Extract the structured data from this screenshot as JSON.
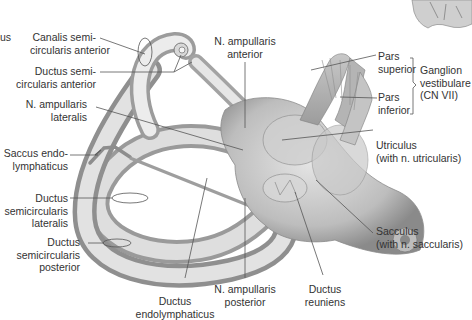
{
  "figure": {
    "colors": {
      "background": "#ffffff",
      "tissue_light": "#e9e9e9",
      "tissue_mid": "#bdbdbd",
      "tissue_dark": "#7a7a7a",
      "leader": "#555555",
      "text": "#333333"
    },
    "cropped_fragment": {
      "text": "us"
    },
    "labels": {
      "canalis_anterior": [
        "Canalis semi-",
        "circularis anterior"
      ],
      "ductus_anterior": [
        "Ductus semi-",
        "circularis anterior"
      ],
      "n_ampullaris_lateralis": [
        "N. ampullaris",
        "lateralis"
      ],
      "saccus": [
        "Saccus endo-",
        "lymphaticus"
      ],
      "ductus_lateralis": [
        "Ductus",
        "semicircularis",
        "lateralis"
      ],
      "ductus_posterior": [
        "Ductus",
        "semicircularis",
        "posterior"
      ],
      "ductus_endolymphaticus": [
        "Ductus",
        "endolymphaticus"
      ],
      "n_ampullaris_posterior": [
        "N. ampullaris",
        "posterior"
      ],
      "ductus_reuniens": [
        "Ductus",
        "reuniens"
      ],
      "n_ampullaris_anterior": [
        "N. ampullaris",
        "anterior"
      ],
      "pars_superior": [
        "Pars",
        "superior"
      ],
      "pars_inferior": [
        "Pars",
        "inferior"
      ],
      "ganglion": [
        "Ganglion",
        "vestibulare",
        "(CN VII)"
      ],
      "utriculus": [
        "Utriculus",
        "(with n. utricularis)"
      ],
      "sacculus": [
        "Sacculus",
        "(with n. saccularis)"
      ]
    }
  }
}
